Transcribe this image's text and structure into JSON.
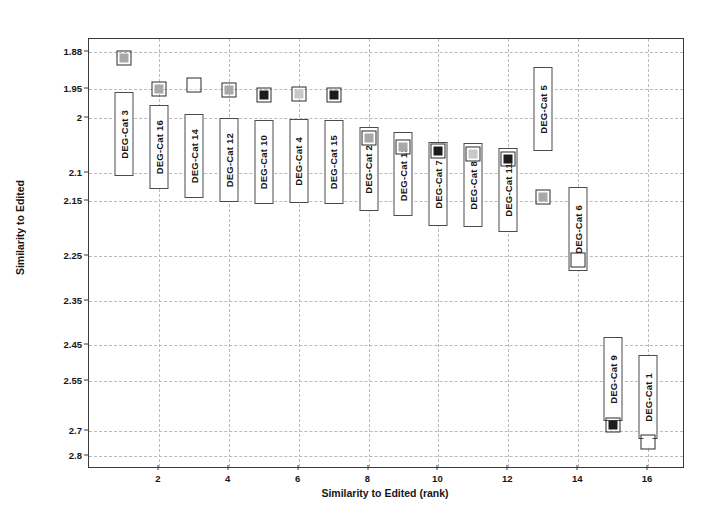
{
  "chart_data": {
    "type": "scatter",
    "title": "",
    "xlabel": "Similarity to Edited (rank)",
    "ylabel": "Similarity to Edited",
    "xlim": [
      0,
      17
    ],
    "ylim_note": "Y axis is reversed (smaller similarity distance at top) and tick spacing is non-uniform",
    "grid": true,
    "legend": "none",
    "x_ticks": [
      2,
      4,
      6,
      8,
      10,
      12,
      14,
      16
    ],
    "y_ticks": [
      "1.88",
      "1.95",
      "2",
      "2.1",
      "2.15",
      "2.25",
      "2.35",
      "2.45",
      "2.55",
      "2.7",
      "2.8"
    ],
    "point_label_prefix": "DEG-Cat",
    "categories": [
      1,
      2,
      3,
      4,
      5,
      6,
      7,
      8,
      9,
      10,
      11,
      12,
      13,
      14,
      15,
      16
    ],
    "points": [
      {
        "rank": 1,
        "label": "DEG-Cat 3",
        "value": 1.9,
        "fill": "gray"
      },
      {
        "rank": 2,
        "label": "DEG-Cat 16",
        "value": 1.94,
        "fill": "gray"
      },
      {
        "rank": 3,
        "label": "DEG-Cat 14",
        "value": 1.95,
        "fill": "white"
      },
      {
        "rank": 4,
        "label": "DEG-Cat 12",
        "value": 1.955,
        "fill": "gray"
      },
      {
        "rank": 5,
        "label": "DEG-Cat 10",
        "value": 1.965,
        "fill": "black"
      },
      {
        "rank": 6,
        "label": "DEG-Cat 4",
        "value": 1.962,
        "fill": "lightgray"
      },
      {
        "rank": 7,
        "label": "DEG-Cat 15",
        "value": 1.965,
        "fill": "black"
      },
      {
        "rank": 8,
        "label": "DEG-Cat 2",
        "value": 1.99,
        "fill": "gray"
      },
      {
        "rank": 9,
        "label": "DEG-Cat 13",
        "value": 2.0,
        "fill": "gray"
      },
      {
        "rank": 10,
        "label": "DEG-Cat 7",
        "value": 2.005,
        "fill": "black"
      },
      {
        "rank": 11,
        "label": "DEG-Cat 8",
        "value": 2.01,
        "fill": "lightgray"
      },
      {
        "rank": 12,
        "label": "DEG-Cat 11",
        "value": 2.02,
        "fill": "black"
      },
      {
        "rank": 13,
        "label": "DEG-Cat 5",
        "value": 2.08,
        "fill": "gray"
      },
      {
        "rank": 14,
        "label": "DEG-Cat 6",
        "value": 2.27,
        "fill": "white"
      },
      {
        "rank": 15,
        "label": "DEG-Cat 9",
        "value": 2.7,
        "fill": "black"
      },
      {
        "rank": 16,
        "label": "DEG-Cat 1",
        "value": 2.75,
        "fill": "white"
      }
    ],
    "marker_colors": {
      "gray": "#a8a8a8",
      "lightgray": "#c8c8c8",
      "white": "#ffffff",
      "black": "#1c1c1c",
      "outline": "#2a2a2a"
    },
    "grid_color": "#b9b9c4",
    "axis_color": "#3a3a3a"
  },
  "geometry": {
    "y_tick_pixels": [
      51,
      88,
      117,
      172,
      200,
      255,
      300,
      344,
      380,
      430,
      455
    ],
    "marker_pixels_y": [
      57,
      88,
      84,
      89,
      94,
      93,
      94,
      137,
      146,
      150,
      153,
      158,
      196,
      259,
      424,
      441
    ],
    "label_boxes": [
      {
        "rank": 1,
        "top": 91,
        "height": 84,
        "width": 19
      },
      {
        "rank": 2,
        "top": 104,
        "height": 84,
        "width": 19
      },
      {
        "rank": 3,
        "top": 113,
        "height": 84,
        "width": 19
      },
      {
        "rank": 4,
        "top": 117,
        "height": 84,
        "width": 19
      },
      {
        "rank": 5,
        "top": 119,
        "height": 84,
        "width": 19
      },
      {
        "rank": 6,
        "top": 118,
        "height": 84,
        "width": 19
      },
      {
        "rank": 7,
        "top": 119,
        "height": 84,
        "width": 19
      },
      {
        "rank": 8,
        "top": 126,
        "height": 84,
        "width": 19
      },
      {
        "rank": 9,
        "top": 131,
        "height": 84,
        "width": 19
      },
      {
        "rank": 10,
        "top": 141,
        "height": 84,
        "width": 19
      },
      {
        "rank": 11,
        "top": 142,
        "height": 84,
        "width": 19
      },
      {
        "rank": 12,
        "top": 147,
        "height": 84,
        "width": 19
      },
      {
        "rank": 13,
        "top": 66,
        "height": 84,
        "width": 19
      },
      {
        "rank": 14,
        "top": 186,
        "height": 84,
        "width": 19
      },
      {
        "rank": 15,
        "top": 336,
        "height": 84,
        "width": 19
      },
      {
        "rank": 16,
        "top": 354,
        "height": 84,
        "width": 19
      }
    ]
  }
}
